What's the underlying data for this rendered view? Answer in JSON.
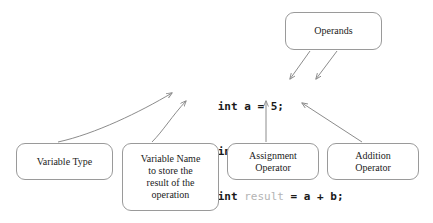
{
  "diagram": {
    "background_color": "#ffffff",
    "line_color": "#8c8c8c",
    "text_color": "#1c1c1c",
    "muted_code_color": "#b4b4b4"
  },
  "code": {
    "lines": [
      {
        "id": "line-1",
        "tokens": [
          {
            "text": "int",
            "style": "keyword"
          },
          {
            "text": " a = 5;",
            "style": "plain"
          }
        ]
      },
      {
        "id": "line-2",
        "tokens": [
          {
            "text": "int",
            "style": "keyword"
          },
          {
            "text": " b = 10;",
            "style": "plain"
          }
        ]
      },
      {
        "id": "line-3",
        "tokens": [
          {
            "text": "int",
            "style": "keyword"
          },
          {
            "text": " ",
            "style": "plain"
          },
          {
            "text": "result",
            "style": "muted"
          },
          {
            "text": " = a + b;",
            "style": "plain"
          }
        ]
      }
    ],
    "line_1_text": "int a = 5;",
    "line_2_text": "int b = 10;",
    "line_3_text": "int result = a + b;"
  },
  "boxes": {
    "operands": {
      "label": "Operands"
    },
    "variable_type": {
      "label": "Variable Type"
    },
    "variable_name": {
      "label": "Variable Name\nto store the\nresult of the\noperation"
    },
    "assignment_operator": {
      "label": "Assignment\nOperator"
    },
    "addition_operator": {
      "label": "Addition\nOperator"
    }
  },
  "connectors": [
    {
      "id": "operands-to-a",
      "from": "operands",
      "to": "operand-a",
      "shape": "straight-diagonal"
    },
    {
      "id": "operands-to-b",
      "from": "operands",
      "to": "operand-b",
      "shape": "straight-diagonal"
    },
    {
      "id": "variable-type-to-int",
      "from": "variable_type",
      "to": "int-keyword",
      "shape": "curved"
    },
    {
      "id": "variable-name-to-result",
      "from": "variable_name",
      "to": "result-identifier",
      "shape": "curved"
    },
    {
      "id": "assignment-operator-to-equals",
      "from": "assignment_operator",
      "to": "equals-sign",
      "shape": "straight-vertical"
    },
    {
      "id": "addition-operator-to-plus",
      "from": "addition_operator",
      "to": "plus-sign",
      "shape": "straight-diagonal"
    }
  ]
}
